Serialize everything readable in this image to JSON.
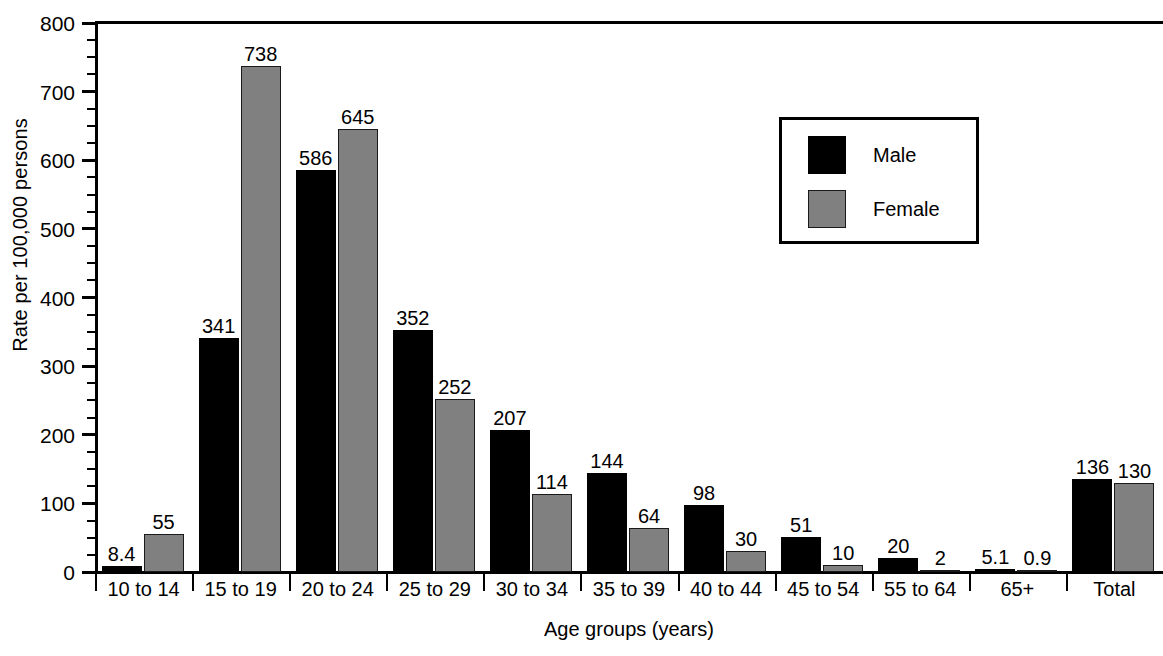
{
  "chart_data": {
    "type": "bar",
    "title": "",
    "xlabel": "Age groups (years)",
    "ylabel": "Rate per 100,000 persons",
    "categories": [
      "10 to 14",
      "15 to 19",
      "20 to 24",
      "25 to 29",
      "30 to 34",
      "35 to 39",
      "40 to 44",
      "45 to 54",
      "55 to 64",
      "65+",
      "Total"
    ],
    "series": [
      {
        "name": "Male",
        "color": "#000000",
        "values": [
          8.4,
          341,
          586,
          352,
          207,
          144,
          98,
          51,
          20,
          5.1,
          136
        ],
        "labels": [
          "8.4",
          "341",
          "586",
          "352",
          "207",
          "144",
          "98",
          "51",
          "20",
          "5.1",
          "136"
        ]
      },
      {
        "name": "Female",
        "color": "#808080",
        "values": [
          55,
          738,
          645,
          252,
          114,
          64,
          30,
          10,
          2,
          0.9,
          130
        ],
        "labels": [
          "55",
          "738",
          "645",
          "252",
          "114",
          "64",
          "30",
          "10",
          "2",
          "0.9",
          "130"
        ]
      }
    ],
    "ylim": [
      0,
      800
    ],
    "ytick_labels": [
      "0",
      "100",
      "200",
      "300",
      "400",
      "500",
      "600",
      "700",
      "800"
    ],
    "ytick_values": [
      0,
      100,
      200,
      300,
      400,
      500,
      600,
      700,
      800
    ],
    "yminor_interval": 25,
    "grid": false,
    "legend_position": "upper-right",
    "legend_entries": [
      "Male",
      "Female"
    ]
  }
}
